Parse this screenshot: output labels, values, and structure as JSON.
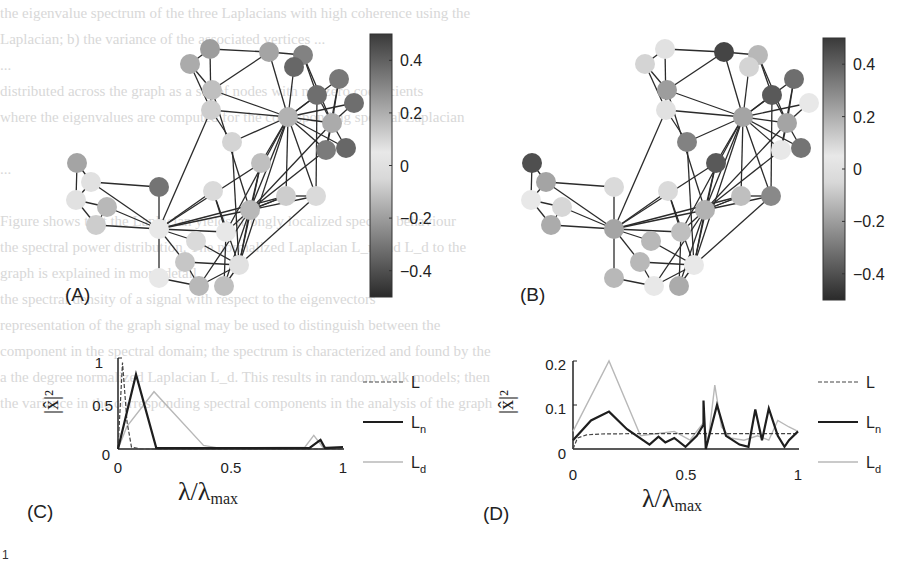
{
  "figure": {
    "panels": {
      "A": {
        "label": "(A)"
      },
      "B": {
        "label": "(B)"
      },
      "C": {
        "label": "(C)"
      },
      "D": {
        "label": "(D)"
      }
    },
    "colorbar": {
      "ticks": [
        "0.4",
        "0.2",
        "0",
        "−0.2",
        "−0.4"
      ],
      "range": [
        -0.5,
        0.5
      ]
    },
    "axis_labels": {
      "x_main": "λ/λ",
      "x_sub": "max",
      "y": "|x̂|²"
    },
    "legend": [
      {
        "label": "L",
        "sub": "",
        "style": "dashed"
      },
      {
        "label": "L",
        "sub": "n",
        "style": "solid-dark"
      },
      {
        "label": "L",
        "sub": "d",
        "style": "solid-light"
      }
    ],
    "footer_mark": "1"
  },
  "chart_data": [
    {
      "panel": "C",
      "type": "line",
      "title": "",
      "xlabel": "λ/λ_max",
      "ylabel": "|x̂|^2",
      "xlim": [
        0,
        1
      ],
      "ylim": [
        0,
        1
      ],
      "xticks": [
        "0",
        "0.5",
        "1"
      ],
      "yticks": [
        "0",
        "0.5",
        "1"
      ],
      "grid": false,
      "legend_position": "right",
      "series": [
        {
          "name": "L",
          "style": "dashed",
          "x": [
            0,
            0.02,
            0.04,
            0.06,
            0.1,
            0.5,
            1.0
          ],
          "y": [
            0,
            0.95,
            0.3,
            0.02,
            0,
            0,
            0
          ]
        },
        {
          "name": "L_n",
          "style": "solid-dark",
          "x": [
            0,
            0.08,
            0.17,
            0.5,
            0.85,
            0.9,
            0.92,
            1.0
          ],
          "y": [
            0,
            0.82,
            0.01,
            0.01,
            0.01,
            0.1,
            0.01,
            0.02
          ]
        },
        {
          "name": "L_d",
          "style": "solid-light",
          "x": [
            0,
            0.04,
            0.16,
            0.38,
            0.45,
            0.83,
            0.87,
            0.91,
            1.0
          ],
          "y": [
            0,
            0.25,
            0.63,
            0.04,
            0.01,
            0.02,
            0.15,
            0.02,
            0.02
          ]
        }
      ]
    },
    {
      "panel": "D",
      "type": "line",
      "title": "",
      "xlabel": "λ/λ_max",
      "ylabel": "|x̂|^2",
      "xlim": [
        0,
        1
      ],
      "ylim": [
        0,
        0.2
      ],
      "xticks": [
        "0",
        "0.5",
        "1"
      ],
      "yticks": [
        "0",
        "0.1",
        "0.2"
      ],
      "grid": false,
      "legend_position": "right",
      "series": [
        {
          "name": "L",
          "style": "dashed",
          "x": [
            0,
            0.02,
            0.06,
            0.12,
            0.3,
            1.0
          ],
          "y": [
            0.0,
            0.025,
            0.032,
            0.034,
            0.035,
            0.035
          ]
        },
        {
          "name": "L_n",
          "style": "solid-dark",
          "x": [
            0,
            0.08,
            0.16,
            0.24,
            0.34,
            0.38,
            0.41,
            0.45,
            0.5,
            0.55,
            0.58,
            0.58,
            0.59,
            0.64,
            0.68,
            0.74,
            0.78,
            0.81,
            0.84,
            0.87,
            0.91,
            0.94,
            0.96,
            1.0
          ],
          "y": [
            0.02,
            0.065,
            0.085,
            0.045,
            0.01,
            0.028,
            0.015,
            0.025,
            0.005,
            0.03,
            0.055,
            0.11,
            0.0,
            0.1,
            0.03,
            0.01,
            0.005,
            0.09,
            0.02,
            0.092,
            0.03,
            0.005,
            0.02,
            0.04
          ]
        },
        {
          "name": "L_d",
          "style": "solid-light",
          "x": [
            0,
            0.16,
            0.3,
            0.45,
            0.52,
            0.58,
            0.6,
            0.63,
            0.66,
            0.7,
            0.76,
            0.82,
            0.87,
            0.91,
            0.96,
            1.0
          ],
          "y": [
            0.04,
            0.2,
            0.03,
            0.04,
            0.02,
            0.06,
            0.015,
            0.145,
            0.05,
            0.025,
            0.02,
            0.03,
            0.02,
            0.065,
            0.05,
            0.04
          ]
        }
      ]
    }
  ],
  "graphs": {
    "nodes": [
      [
        210,
        49
      ],
      [
        190,
        64
      ],
      [
        269,
        52
      ],
      [
        303,
        55
      ],
      [
        294,
        67
      ],
      [
        212,
        90
      ],
      [
        339,
        79
      ],
      [
        317,
        95
      ],
      [
        354,
        103
      ],
      [
        288,
        117
      ],
      [
        211,
        110
      ],
      [
        332,
        123
      ],
      [
        346,
        148
      ],
      [
        326,
        150
      ],
      [
        232,
        142
      ],
      [
        261,
        163
      ],
      [
        77,
        163
      ],
      [
        91,
        182
      ],
      [
        76,
        200
      ],
      [
        107,
        207
      ],
      [
        96,
        225
      ],
      [
        159,
        187
      ],
      [
        159,
        229
      ],
      [
        213,
        191
      ],
      [
        250,
        210
      ],
      [
        226,
        232
      ],
      [
        196,
        241
      ],
      [
        185,
        262
      ],
      [
        239,
        265
      ],
      [
        159,
        278
      ],
      [
        199,
        286
      ],
      [
        224,
        286
      ],
      [
        286,
        196
      ],
      [
        316,
        196
      ]
    ],
    "edges": [
      [
        0,
        1
      ],
      [
        0,
        2
      ],
      [
        0,
        10
      ],
      [
        1,
        5
      ],
      [
        1,
        10
      ],
      [
        2,
        3
      ],
      [
        2,
        5
      ],
      [
        2,
        9
      ],
      [
        3,
        7
      ],
      [
        3,
        11
      ],
      [
        5,
        9
      ],
      [
        5,
        24
      ],
      [
        10,
        9
      ],
      [
        10,
        14
      ],
      [
        10,
        22
      ],
      [
        9,
        4
      ],
      [
        9,
        6
      ],
      [
        9,
        7
      ],
      [
        9,
        8
      ],
      [
        9,
        11
      ],
      [
        9,
        12
      ],
      [
        9,
        13
      ],
      [
        9,
        14
      ],
      [
        9,
        15
      ],
      [
        9,
        24
      ],
      [
        9,
        25
      ],
      [
        9,
        32
      ],
      [
        9,
        33
      ],
      [
        9,
        28
      ],
      [
        7,
        11
      ],
      [
        7,
        33
      ],
      [
        6,
        11
      ],
      [
        6,
        13
      ],
      [
        8,
        11
      ],
      [
        11,
        12
      ],
      [
        11,
        13
      ],
      [
        11,
        24
      ],
      [
        13,
        24
      ],
      [
        14,
        28
      ],
      [
        15,
        24
      ],
      [
        15,
        28
      ],
      [
        16,
        17
      ],
      [
        16,
        18
      ],
      [
        17,
        18
      ],
      [
        17,
        21
      ],
      [
        17,
        22
      ],
      [
        18,
        19
      ],
      [
        18,
        20
      ],
      [
        19,
        20
      ],
      [
        19,
        22
      ],
      [
        20,
        22
      ],
      [
        21,
        22
      ],
      [
        22,
        23
      ],
      [
        22,
        24
      ],
      [
        22,
        25
      ],
      [
        22,
        26
      ],
      [
        22,
        27
      ],
      [
        22,
        29
      ],
      [
        22,
        15
      ],
      [
        22,
        32
      ],
      [
        23,
        25
      ],
      [
        23,
        28
      ],
      [
        24,
        25
      ],
      [
        24,
        28
      ],
      [
        24,
        30
      ],
      [
        24,
        31
      ],
      [
        24,
        32
      ],
      [
        24,
        33
      ],
      [
        25,
        31
      ],
      [
        26,
        28
      ],
      [
        27,
        30
      ],
      [
        27,
        28
      ],
      [
        29,
        30
      ],
      [
        30,
        28
      ],
      [
        31,
        28
      ],
      [
        32,
        33
      ],
      [
        33,
        28
      ],
      [
        32,
        24
      ]
    ],
    "A": {
      "dx": 0,
      "dy": 0,
      "values": [
        0.22,
        0.18,
        0.2,
        0.3,
        0.38,
        0.12,
        0.33,
        0.36,
        0.36,
        0.16,
        0.08,
        0.18,
        0.38,
        0.32,
        0.06,
        0.12,
        0.2,
        0.02,
        0.02,
        0.14,
        0.08,
        0.34,
        0.0,
        0.04,
        0.14,
        0.0,
        0.04,
        0.1,
        0.02,
        0.0,
        0.14,
        0.12,
        0.08,
        0.04
      ]
    },
    "B": {
      "dx": 455,
      "dy": 0,
      "values": [
        0.02,
        0.06,
        0.48,
        0.14,
        0.06,
        0.22,
        0.36,
        0.42,
        0.0,
        0.2,
        0.02,
        0.2,
        0.34,
        0.0,
        0.3,
        0.42,
        -0.45,
        0.2,
        0.0,
        0.05,
        0.18,
        0.04,
        -0.2,
        0.04,
        0.16,
        0.12,
        0.14,
        0.14,
        0.0,
        0.14,
        0.0,
        0.18,
        0.12,
        0.28
      ]
    }
  },
  "background_lines": [
    "the eigenvalue spectrum of the three Laplacians with high coherence using the",
    "Laplacian; b) the variance of the associated vertices         ...",
    "                                         ...",
    "          distributed across the graph as a set of nodes with nonzero coefficients",
    "where the eigenvalues are computed for the corresponding spectral Laplacian",
    "",
    "                                         ...",
    "",
    "Figure shows that the Laplacian yields strongly localized spectral behaviour",
    "the spectral power distribution. The normalized Laplacian L_n and L_d to the",
    "graph is explained in more detail.",
    "the spectral density of a signal with respect to the eigenvectors",
    "representation of the graph signal may be used to distinguish between the",
    "component in the spectral domain; the spectrum is characterized and found by the",
    "  a the degree normalized Laplacian L_d. This results in random walk models; then",
    "the variance in the corresponding spectral components in the analysis of the graph",
    "",
    "",
    "",
    "",
    "",
    "  "
  ]
}
